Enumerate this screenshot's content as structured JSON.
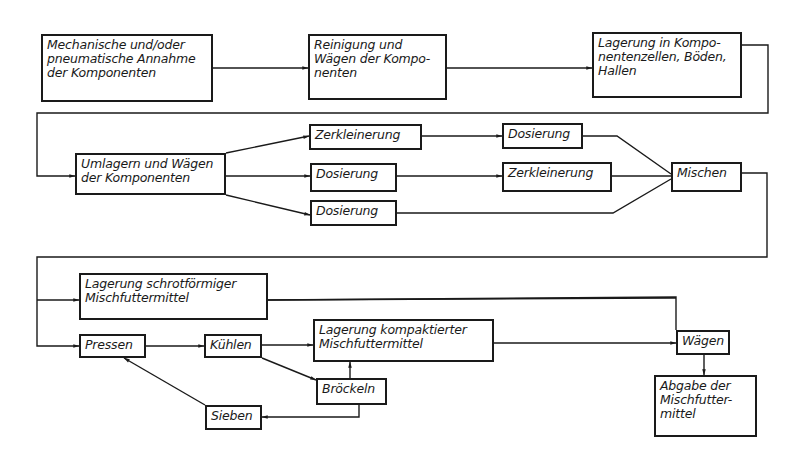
{
  "diagram": {
    "type": "process-flowchart",
    "nodes": [
      {
        "id": "n1",
        "label": "Mechanische und/oder\npneumatische Annahme\nder Komponenten",
        "box": [
          41,
          34,
          172,
          68
        ]
      },
      {
        "id": "n2",
        "label": "Reinigung und\n Wägen der Kompo-\n   nenten",
        "box": [
          308,
          34,
          139,
          66
        ]
      },
      {
        "id": "n3",
        "label": "Lagerung in Kompo-\nnentenzellen, Böden,\n Hallen",
        "box": [
          592,
          32,
          150,
          66
        ]
      },
      {
        "id": "n4",
        "label": "Umlagern und Wägen\nder Komponenten",
        "box": [
          75,
          153,
          151,
          42
        ]
      },
      {
        "id": "n5",
        "label": "Zerkleinerung",
        "box": [
          309,
          124,
          113,
          26
        ]
      },
      {
        "id": "n6",
        "label": "Dosierung",
        "box": [
          310,
          163,
          87,
          29
        ]
      },
      {
        "id": "n7",
        "label": "Dosierung",
        "box": [
          310,
          200,
          87,
          26
        ]
      },
      {
        "id": "n8",
        "label": "Dosierung",
        "box": [
          502,
          123,
          81,
          26
        ]
      },
      {
        "id": "n9",
        "label": "Zerkleinerung",
        "box": [
          502,
          162,
          110,
          30
        ]
      },
      {
        "id": "n10",
        "label": "Mischen",
        "box": [
          671,
          162,
          71,
          30
        ]
      },
      {
        "id": "n11",
        "label": "Lagerung schrotförmiger\nMischfuttermittel",
        "box": [
          79,
          273,
          189,
          47
        ]
      },
      {
        "id": "n12",
        "label": "Pressen",
        "box": [
          79,
          334,
          67,
          24
        ]
      },
      {
        "id": "n13",
        "label": "Kühlen",
        "box": [
          204,
          334,
          58,
          24
        ]
      },
      {
        "id": "n14",
        "label": "Lagerung kompaktierter\nMischfuttermittel",
        "box": [
          313,
          319,
          181,
          43
        ]
      },
      {
        "id": "n15",
        "label": "Bröckeln",
        "box": [
          316,
          378,
          71,
          27
        ]
      },
      {
        "id": "n16",
        "label": "Sieben",
        "box": [
          205,
          405,
          57,
          25
        ]
      },
      {
        "id": "n17",
        "label": "Wägen",
        "box": [
          676,
          330,
          54,
          25
        ]
      },
      {
        "id": "n18",
        "label": "Abgabe der\nMischfutter-\nmittel",
        "box": [
          654,
          375,
          103,
          62
        ]
      }
    ],
    "edges": [
      {
        "from": "n1",
        "to": "n2"
      },
      {
        "from": "n2",
        "to": "n3"
      },
      {
        "from": "n3",
        "to": "n4"
      },
      {
        "from": "n4",
        "to": "n5"
      },
      {
        "from": "n4",
        "to": "n6"
      },
      {
        "from": "n4",
        "to": "n7"
      },
      {
        "from": "n5",
        "to": "n8"
      },
      {
        "from": "n6",
        "to": "n9"
      },
      {
        "from": "n8",
        "to": "n10"
      },
      {
        "from": "n9",
        "to": "n10"
      },
      {
        "from": "n7",
        "to": "n10"
      },
      {
        "from": "n10",
        "to": "n11"
      },
      {
        "from": "n10",
        "to": "n12"
      },
      {
        "from": "n11",
        "to": "n17"
      },
      {
        "from": "n12",
        "to": "n13"
      },
      {
        "from": "n13",
        "to": "n14"
      },
      {
        "from": "n13",
        "to": "n15"
      },
      {
        "from": "n15",
        "to": "n14"
      },
      {
        "from": "n15",
        "to": "n16"
      },
      {
        "from": "n16",
        "to": "n12"
      },
      {
        "from": "n14",
        "to": "n17"
      },
      {
        "from": "n17",
        "to": "n18"
      }
    ],
    "paths": [
      {
        "d": "M213,68 L308,68",
        "arrow": true
      },
      {
        "d": "M447,68 L592,68",
        "arrow": true
      },
      {
        "d": "M742,45 L768,45 L768,113 L37,113 L37,176 L75,176",
        "arrow": true
      },
      {
        "d": "M226,153 L309,136",
        "arrow": true
      },
      {
        "d": "M226,176 L310,176",
        "arrow": true
      },
      {
        "d": "M226,195 L310,215",
        "arrow": true
      },
      {
        "d": "M422,136 L502,136",
        "arrow": true
      },
      {
        "d": "M397,176 L502,176",
        "arrow": true
      },
      {
        "d": "M583,136 L617,136 L671,174",
        "arrow": false
      },
      {
        "d": "M612,176 L671,176",
        "arrow": false
      },
      {
        "d": "M397,213 L613,213 L671,179",
        "arrow": false
      },
      {
        "d": "M742,173 L767,173 L767,257 L37,257 L37,346 L79,346",
        "arrow": true
      },
      {
        "d": "M37,300 L79,300",
        "arrow": true
      },
      {
        "d": "M268,300 L676,298 M676,298 L676,298",
        "arrow": false
      },
      {
        "d": "M268,300 L676,297 L676,298",
        "arrow": false
      },
      {
        "d": "M146,346 L204,346",
        "arrow": true
      },
      {
        "d": "M262,345 L313,345",
        "arrow": true
      },
      {
        "d": "M262,358 L316,380",
        "arrow": true
      },
      {
        "d": "M350,378 L350,362",
        "arrow": true
      },
      {
        "d": "M359,405 L359,417 L262,417",
        "arrow": true
      },
      {
        "d": "M205,405 L124,358",
        "arrow": true
      },
      {
        "d": "M494,343 L676,343",
        "arrow": true
      },
      {
        "d": "M676,298 L676,330",
        "arrow": false
      },
      {
        "d": "M704,355 L704,375",
        "arrow": true
      }
    ],
    "style": {
      "stroke": "#1a1a1a",
      "background": "#ffffff"
    }
  }
}
